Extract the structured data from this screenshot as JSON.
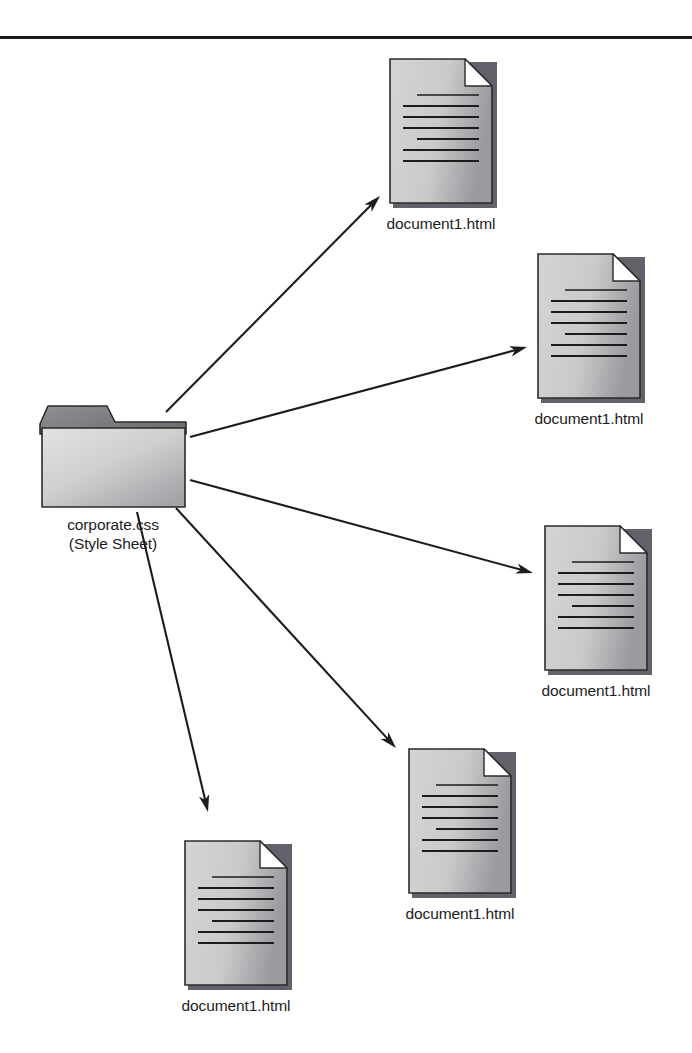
{
  "diagram": {
    "type": "radial-link-diagram",
    "background_color": "#ffffff",
    "rule": {
      "name": "top-horizontal-rule",
      "color": "#1a1a1a"
    },
    "colors": {
      "icon_fill_light": "#d4d4d4",
      "icon_fill_dark": "#9a9a9f",
      "icon_outline": "#2b2b2b",
      "icon_shadow": "#62636a",
      "line_color": "#1c1c1c",
      "text_color": "#1c1c1c",
      "fold_fill": "#ffffff"
    },
    "source": {
      "name": "corporate-css-folder",
      "icon": "folder-icon",
      "label_line1": "corporate.css",
      "label_line2": "(Style Sheet)",
      "x": 38,
      "y": 404,
      "width": 150,
      "height": 106
    },
    "targets": [
      {
        "name": "document-top",
        "icon": "document-icon",
        "label": "document1.html",
        "x": 389,
        "y": 58,
        "width": 104,
        "height": 146,
        "text_lines": 7
      },
      {
        "name": "document-upper-right",
        "icon": "document-icon",
        "label": "document1.html",
        "x": 537,
        "y": 253,
        "width": 104,
        "height": 146,
        "text_lines": 7
      },
      {
        "name": "document-lower-right",
        "icon": "document-icon",
        "label": "document1.html",
        "x": 544,
        "y": 525,
        "width": 104,
        "height": 146,
        "text_lines": 7
      },
      {
        "name": "document-bottom-center",
        "icon": "document-icon",
        "label": "document1.html",
        "x": 408,
        "y": 748,
        "width": 104,
        "height": 146,
        "text_lines": 7
      },
      {
        "name": "document-bottom-left",
        "icon": "document-icon",
        "label": "document1.html",
        "x": 184,
        "y": 840,
        "width": 104,
        "height": 146,
        "text_lines": 7
      }
    ],
    "arrows": [
      {
        "name": "arrow-to-document-top",
        "x1": 166,
        "y1": 412,
        "x2": 380,
        "y2": 196
      },
      {
        "name": "arrow-to-document-upper-right",
        "x1": 190,
        "y1": 437,
        "x2": 527,
        "y2": 347
      },
      {
        "name": "arrow-to-document-lower-right",
        "x1": 190,
        "y1": 480,
        "x2": 533,
        "y2": 573
      },
      {
        "name": "arrow-to-document-bottom-center",
        "x1": 176,
        "y1": 508,
        "x2": 396,
        "y2": 748
      },
      {
        "name": "arrow-to-document-bottom-left",
        "x1": 137,
        "y1": 512,
        "x2": 208,
        "y2": 812
      }
    ]
  }
}
